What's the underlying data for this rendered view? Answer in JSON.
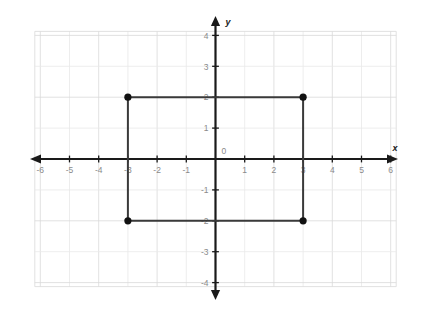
{
  "chart_data": {
    "type": "scatter",
    "title": "",
    "xlabel": "x",
    "ylabel": "y",
    "xlim": [
      -6.6,
      6.6
    ],
    "ylim": [
      -4.6,
      4.6
    ],
    "grid": true,
    "grid_step": 1,
    "legend": "none",
    "origin_label": "0",
    "x_ticks": [
      -6,
      -5,
      -4,
      -3,
      -2,
      -1,
      1,
      2,
      3,
      4,
      5,
      6
    ],
    "x_tick_labels": [
      "-6",
      "-5",
      "-4",
      "-3",
      "-2",
      "-1",
      "1",
      "2",
      "3",
      "4",
      "5",
      "6"
    ],
    "y_ticks": [
      4,
      3,
      2,
      1,
      -1,
      -2,
      -3,
      -4
    ],
    "y_tick_labels": [
      "4",
      "3",
      "2",
      "1",
      "-1",
      "-2",
      "-3",
      "-4"
    ],
    "series": [
      {
        "name": "rectangle",
        "shape": "rectangle",
        "closed": true,
        "points": [
          {
            "x": -3,
            "y": 2,
            "label": "(-3, 2)"
          },
          {
            "x": 3,
            "y": 2,
            "label": "(3, 2)"
          },
          {
            "x": 3,
            "y": -2,
            "label": "(3, -2)"
          },
          {
            "x": -3,
            "y": -2,
            "label": "(-3, -2)"
          }
        ],
        "edge_color": "#3a3a3a",
        "vertex_color": "#111111",
        "width_units": 6,
        "height_units": 4
      }
    ],
    "colors": {
      "grid": "#d9d9d9",
      "axis": "#1a1a1a",
      "tick_label": "#8a8a8a",
      "shape_edge": "#3a3a3a",
      "vertex": "#111111",
      "background": "#ffffff"
    }
  }
}
